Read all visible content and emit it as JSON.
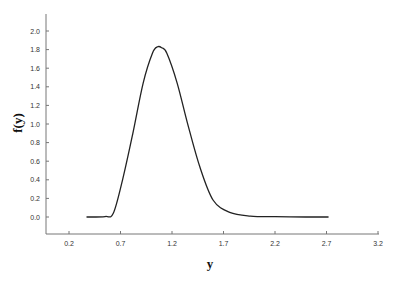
{
  "chart_data": {
    "type": "line",
    "title": "",
    "xlabel": "y",
    "ylabel": "f(y)",
    "xlim": [
      0.0,
      3.2
    ],
    "ylim": [
      -0.18,
      2.2
    ],
    "grid": false,
    "legend": null,
    "x_ticks": [
      "0.2",
      "0.7",
      "1.2",
      "1.7",
      "2.2",
      "2.7",
      "3.2"
    ],
    "y_ticks": [
      "0.0",
      "0.2",
      "0.4",
      "0.6",
      "0.8",
      "1.0",
      "1.2",
      "1.4",
      "1.6",
      "1.8",
      "2.0"
    ],
    "series": [
      {
        "name": "f(y)",
        "color": "#222222",
        "x": [
          0.37,
          0.55,
          0.63,
          0.72,
          0.82,
          0.92,
          1.01,
          1.06,
          1.1,
          1.15,
          1.25,
          1.35,
          1.47,
          1.6,
          1.76,
          1.96,
          2.2,
          2.5,
          2.72
        ],
        "y": [
          0.0,
          0.005,
          0.04,
          0.4,
          0.9,
          1.44,
          1.76,
          1.83,
          1.82,
          1.76,
          1.44,
          1.01,
          0.54,
          0.18,
          0.05,
          0.01,
          0.003,
          0.0,
          0.0
        ]
      }
    ]
  }
}
